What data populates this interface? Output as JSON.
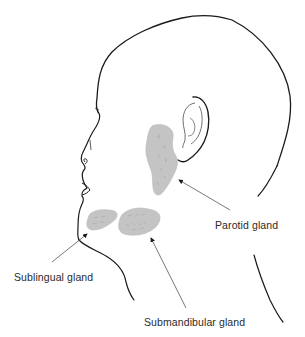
{
  "diagram": {
    "colors": {
      "outline": "#1a1a1a",
      "gland_fill": "#c4c4c4",
      "gland_texture": "#a8a8a8",
      "leader_line": "#555555",
      "text": "#2a2a2a",
      "background": "#ffffff"
    },
    "labels": {
      "parotid": "Parotid gland",
      "sublingual": "Sublingual gland",
      "submandibular": "Submandibular gland"
    },
    "glands": [
      {
        "id": "parotid",
        "label": "Parotid gland",
        "location": "in front of and below the ear"
      },
      {
        "id": "sublingual",
        "label": "Sublingual gland",
        "location": "beneath the chin, front"
      },
      {
        "id": "submandibular",
        "label": "Submandibular gland",
        "location": "beneath the jaw"
      }
    ]
  }
}
